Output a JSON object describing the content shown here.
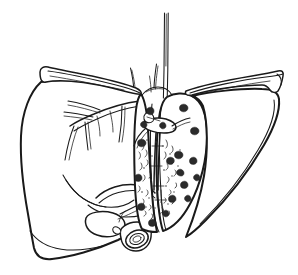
{
  "figure": {
    "title": "Liver",
    "subject": "liver-anatomical-line-drawing",
    "style": "black-and-white ink line drawing",
    "background_color": "#ffffff",
    "ink_color": "#1a1a1a",
    "nodule_color": "#2b2b2b",
    "canvas": {
      "width": 298,
      "height": 275
    }
  },
  "parts": {
    "left_lobe": "Left lobe of liver",
    "right_lobe": "Right lobe of liver",
    "cut_surface": "Cut surface (transected medial face)",
    "falciform_ligament": "Falciform ligament",
    "coronary_ligament_left": "Left coronary / triangular ligament flap",
    "coronary_ligament_right": "Right coronary / triangular ligament flap",
    "inferior_vena_cava": "Inferior vena cava",
    "hepatic_veins": "Hepatic veins",
    "portal_vein_branches": "Portal vein branches",
    "hepatic_artery": "Hepatic artery",
    "bile_duct_stump": "Cut bile duct / vessel stump",
    "gallbladder": "Gallbladder",
    "surface_nodules": "Nodular lesions on cut surface",
    "parenchyma_stipple": "Stippled parenchyma texture"
  },
  "labels": [],
  "annotations": [],
  "counts": {
    "nodules": 18,
    "stipple_marks": 64
  }
}
